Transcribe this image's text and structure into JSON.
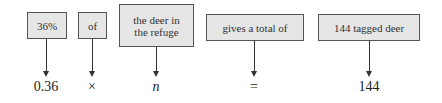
{
  "diagram": {
    "columns": [
      {
        "phrase": "36%",
        "math": "0.36"
      },
      {
        "phrase": "of",
        "math": "×"
      },
      {
        "phrase_lines": [
          "the deer in",
          "the refuge"
        ],
        "math": "n"
      },
      {
        "phrase": "gives a total of",
        "math": "="
      },
      {
        "phrase": "144 tagged deer",
        "math": "144"
      }
    ]
  }
}
